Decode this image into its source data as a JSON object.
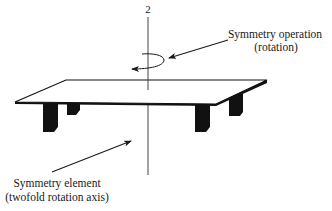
{
  "diagram": {
    "axis_label": "2",
    "operation_label": {
      "line1": "Symmetry operation",
      "line2": "(rotation)"
    },
    "element_label": {
      "line1": "Symmetry element",
      "line2": "(twofold rotation axis)"
    },
    "object": "table",
    "colors": {
      "ink": "#1a1a1a",
      "background": "#ffffff",
      "axis": "#444444"
    }
  }
}
